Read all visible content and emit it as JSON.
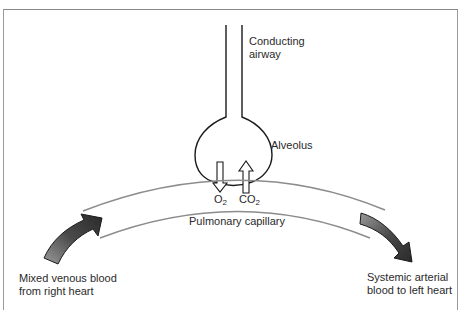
{
  "labels": {
    "conducting_airway_line1": "Conducting",
    "conducting_airway_line2": "airway",
    "alveolus": "Alveolus",
    "o2_main": "O",
    "o2_sub": "2",
    "co2_main": "CO",
    "co2_sub": "2",
    "pulmonary_capillary": "Pulmonary capillary",
    "venous_line1": "Mixed venous blood",
    "venous_line2": "from right heart",
    "arterial_line1": "Systemic arterial",
    "arterial_line2": "blood to left heart"
  },
  "colors": {
    "frame": "#8a8a8a",
    "airway_stroke": "#1a1a1a",
    "capillary_stroke": "#8c8c8c",
    "flow_arrow_fill": "#555555",
    "text": "#2a2a2a"
  }
}
